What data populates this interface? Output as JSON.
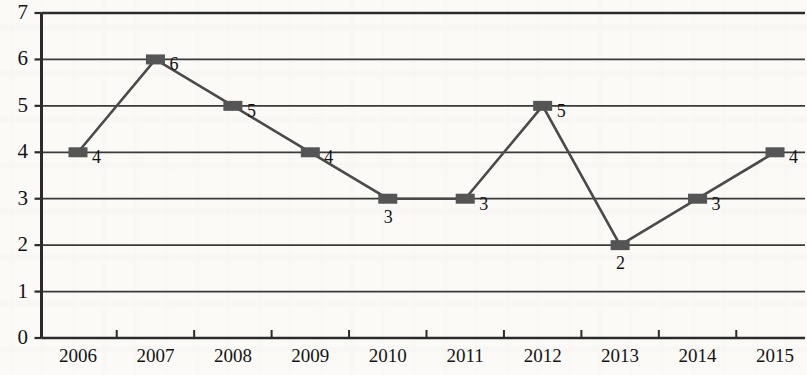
{
  "chart_data": {
    "type": "line",
    "title": "",
    "subtitle": "",
    "xlabel": "",
    "ylabel": "",
    "categories": [
      "2006",
      "2007",
      "2008",
      "2009",
      "2010",
      "2011",
      "2012",
      "2013",
      "2014",
      "2015"
    ],
    "values": [
      4,
      6,
      5,
      4,
      3,
      3,
      5,
      2,
      3,
      4
    ],
    "point_labels": [
      "4",
      "6",
      "5",
      "4",
      "3",
      "3",
      "5",
      "2",
      "3",
      "4"
    ],
    "series": [
      {
        "name": "",
        "values": [
          4,
          6,
          5,
          4,
          3,
          3,
          5,
          2,
          3,
          4
        ]
      }
    ],
    "ylim": [
      0,
      7
    ],
    "y_ticks": [
      "0",
      "1",
      "2",
      "3",
      "4",
      "5",
      "6",
      "7"
    ],
    "y_tick_values": [
      0,
      1,
      2,
      3,
      4,
      5,
      6,
      7
    ],
    "grid": true,
    "grid_axis": "y",
    "legend": false,
    "legend_position": "none",
    "marker": "square",
    "colors": {
      "line": "#4a4a4a",
      "marker": "#555555",
      "grid": "#3a3a3a",
      "axis": "#2b2b2b",
      "text": "#141414",
      "background": "#fbfaf7"
    }
  }
}
